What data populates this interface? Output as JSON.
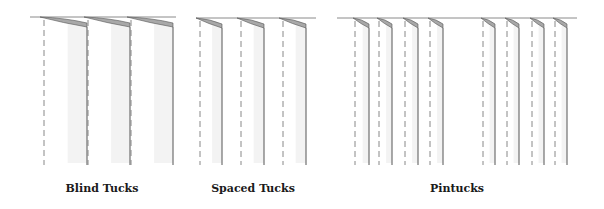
{
  "diagram": {
    "colors": {
      "line": "#555555",
      "dash": "#888888",
      "tuck_fill": "#a8a8a8",
      "shade": "#eeeeee",
      "top_line": "#8a8a8a"
    },
    "panels": [
      {
        "id": "blind",
        "label": "Blind Tucks",
        "label_x": 102,
        "top_y": 17,
        "bottom_y": 165,
        "x_start": 30,
        "x_end": 176,
        "tucks": [
          {
            "dash_x": 44,
            "solid_x": 87
          },
          {
            "dash_x": 88,
            "solid_x": 130
          },
          {
            "dash_x": 131,
            "solid_x": 173
          }
        ]
      },
      {
        "id": "spaced",
        "label": "Spaced Tucks",
        "label_x": 253,
        "top_y": 18,
        "bottom_y": 165,
        "x_start": 196,
        "x_end": 316,
        "tucks": [
          {
            "dash_x": 200,
            "solid_x": 222
          },
          {
            "dash_x": 241,
            "solid_x": 264
          },
          {
            "dash_x": 283,
            "solid_x": 306
          }
        ]
      },
      {
        "id": "pintucks",
        "label": "Pintucks",
        "label_x": 457,
        "top_y": 18,
        "bottom_y": 165,
        "x_start": 337,
        "x_end": 577,
        "tucks": [
          {
            "dash_x": 355,
            "solid_x": 369
          },
          {
            "dash_x": 379,
            "solid_x": 392
          },
          {
            "dash_x": 405,
            "solid_x": 418
          },
          {
            "dash_x": 430,
            "solid_x": 443
          },
          {
            "dash_x": 483,
            "solid_x": 495
          },
          {
            "dash_x": 507,
            "solid_x": 519
          },
          {
            "dash_x": 532,
            "solid_x": 544
          },
          {
            "dash_x": 555,
            "solid_x": 567
          }
        ]
      }
    ]
  }
}
